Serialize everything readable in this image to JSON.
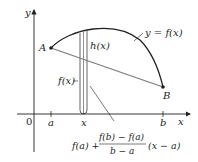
{
  "diagram": {
    "axes": {
      "y_label": "y",
      "x_label": "x",
      "origin_label": "0"
    },
    "points": {
      "A": "A",
      "B": "B"
    },
    "ticks": {
      "a": "a",
      "x": "x",
      "b": "b"
    },
    "labels": {
      "curve": "y = f(x)",
      "h": "h(x)",
      "f": "f(x)"
    },
    "formula": {
      "lead": "f(a) +",
      "numerator": "f(b) − f(a)",
      "denominator": "b − a",
      "tail": "(x − a)"
    },
    "colors": {
      "curve": "#231f20",
      "secant": "#7a7a7a",
      "axis": "#231f20"
    }
  }
}
